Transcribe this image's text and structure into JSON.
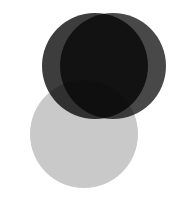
{
  "figure": {
    "title": "Three-circle overlapping Venn diagram",
    "width": 178,
    "height": 203,
    "background_color": "#ffffff",
    "blend_mode": "multiply"
  },
  "chart_data": {
    "type": "venn",
    "title": "",
    "subtitle": "",
    "xlabel": "",
    "ylabel": "",
    "grid": false,
    "legend_position": "none",
    "canvas": {
      "width": 178,
      "height": 203,
      "background": "#ffffff"
    },
    "blend": "multiply",
    "sets": [
      {
        "name": "set-a-top-left",
        "label": "",
        "fill": "#3d3d3d",
        "opacity": 1.0,
        "cx": 95,
        "cy": 66,
        "r": 53
      },
      {
        "name": "set-b-top-right",
        "label": "",
        "fill": "#3d3d3d",
        "opacity": 0.94,
        "cx": 113,
        "cy": 66,
        "r": 53
      },
      {
        "name": "set-c-bottom-left",
        "label": "",
        "fill": "#c9c9c9",
        "opacity": 1.0,
        "cx": 84,
        "cy": 134,
        "r": 54
      }
    ],
    "observed_region_colors": {
      "a_only": "#3a3a3a",
      "b_only": "#3a3a3a",
      "c_only": "#c8c8c8",
      "a_and_b": "#383838",
      "a_and_c": "#9e9e9e",
      "b_and_c": "#2a2a2a",
      "a_and_b_and_c": "#0a0a0a",
      "outside": "#ffffff"
    },
    "annotations": [],
    "tick_labels": [],
    "values": []
  }
}
